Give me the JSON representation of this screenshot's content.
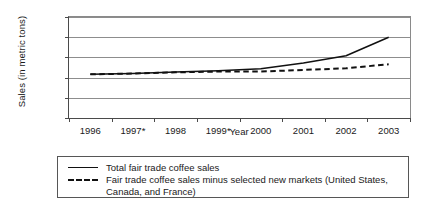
{
  "chart_data": {
    "type": "line",
    "title": "",
    "xlabel": "Year",
    "ylabel": "Sales (in metric tons)",
    "categories": [
      "1996",
      "1997*",
      "1998",
      "1999*",
      "2000",
      "2001",
      "2002",
      "2003"
    ],
    "ylim": [
      0,
      25000
    ],
    "yticks": [
      0,
      5000,
      10000,
      15000,
      20000,
      25000
    ],
    "ytick_labels": [
      "0",
      "5000",
      "10000",
      "15000",
      "20000",
      "25000"
    ],
    "grid": true,
    "legend_position": "below-plot",
    "series": [
      {
        "name": "Total fair trade coffee sales",
        "style": "solid",
        "color": "#111111",
        "values": [
          10800,
          11000,
          11400,
          11700,
          12200,
          13600,
          15400,
          20000
        ]
      },
      {
        "name": "Fair trade coffee sales minus selected new markets (United States, Canada, and France)",
        "style": "dashed",
        "color": "#111111",
        "values": [
          10800,
          11000,
          11300,
          11500,
          11500,
          11900,
          12300,
          13300
        ]
      }
    ]
  },
  "legend": {
    "entries": [
      {
        "label": "Total fair trade coffee sales",
        "style": "solid"
      },
      {
        "label": "Fair trade coffee sales minus selected new markets (United States, Canada, and France)",
        "style": "dashed"
      }
    ]
  }
}
